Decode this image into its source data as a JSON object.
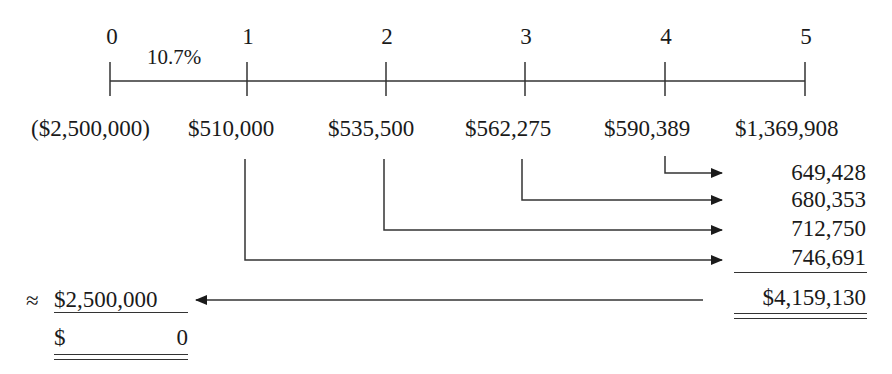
{
  "timeline": {
    "periods": [
      "0",
      "1",
      "2",
      "3",
      "4",
      "5"
    ],
    "rate_label": "10.7%"
  },
  "cash_flows": [
    "($2,500,000)",
    "$510,000",
    "$535,500",
    "$562,275",
    "$590,389",
    "$1,369,908"
  ],
  "future_values": {
    "items": [
      "649,428",
      "680,353",
      "712,750",
      "746,691"
    ],
    "total": "$4,159,130"
  },
  "result": {
    "approx_symbol": "≈",
    "present_value": "$2,500,000",
    "npv_currency": "$",
    "npv_value": "0"
  },
  "colors": {
    "ink": "#1a1a1a",
    "line": "#333333",
    "background": "#ffffff"
  }
}
